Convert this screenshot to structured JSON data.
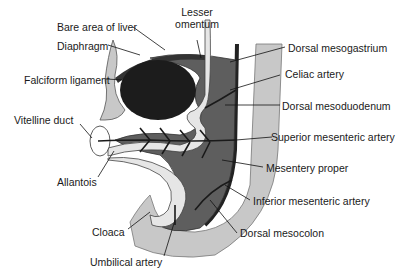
{
  "diagram": {
    "labels": {
      "bare_area_of_liver": "Bare area of liver",
      "lesser_omentum_line1": "Lesser",
      "lesser_omentum_line2": "omentum",
      "diaphragm": "Diaphragm",
      "falciform_ligament": "Falciform ligament",
      "vitelline_duct": "Vitelline duct",
      "allantois": "Allantois",
      "cloaca": "Cloaca",
      "umbilical_artery": "Umbilical artery",
      "dorsal_mesogastrium": "Dorsal mesogastrium",
      "celiac_artery": "Celiac artery",
      "dorsal_mesoduodenum": "Dorsal mesoduodenum",
      "superior_mesenteric_artery": "Superior mesenteric artery",
      "mesentery_proper": "Mesentery proper",
      "inferior_mesenteric_artery": "Inferior mesenteric artery",
      "dorsal_mesocolon": "Dorsal mesocolon"
    },
    "colors": {
      "body_wall": "#c8c8c8",
      "mesentery": "#5a5a5a",
      "liver": "#1c1c1c",
      "gut_tube": "#e6e6e6",
      "artery": "#222222",
      "leader_line": "#111111"
    }
  }
}
